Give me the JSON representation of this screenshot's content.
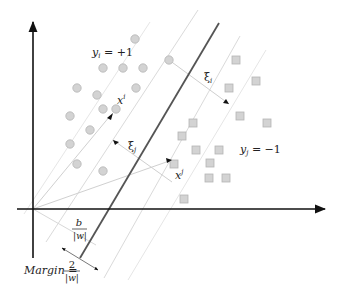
{
  "diagram": {
    "labels": {
      "class_pos": "y",
      "class_pos_sub": "i",
      "class_pos_eq": " = +1",
      "class_neg": "y",
      "class_neg_sub": "j",
      "class_neg_eq": " = −1",
      "xi_top": "ξ",
      "xi_top_sub": "i",
      "xi_mid": "ξ",
      "xi_mid_sub": "j",
      "point_i": "x",
      "point_i_sup": "i",
      "point_j": "x",
      "point_j_sup": "j",
      "bias_num": "b",
      "bias_den": "|w|",
      "margin_label": "Margin",
      "margin_eq": " = ",
      "margin_num": "2",
      "margin_den": "|w|"
    },
    "colors": {
      "axis": "#111111",
      "hyperplane": "#555555",
      "margin_line": "#d8d8d8",
      "guide_line": "#cfcfcf",
      "point_fill": "#d3d3d3",
      "point_stroke": "#b5b5b5"
    },
    "circles": [
      [
        135,
        39
      ],
      [
        103,
        68
      ],
      [
        123,
        68
      ],
      [
        143,
        68
      ],
      [
        169,
        60
      ],
      [
        77,
        88
      ],
      [
        97,
        95
      ],
      [
        136,
        88
      ],
      [
        103,
        109
      ],
      [
        116,
        109
      ],
      [
        70,
        116
      ],
      [
        90,
        130
      ],
      [
        70,
        144
      ],
      [
        77,
        164
      ],
      [
        103,
        171
      ]
    ],
    "squares": [
      [
        236,
        60
      ],
      [
        256,
        81
      ],
      [
        229,
        88
      ],
      [
        193,
        123
      ],
      [
        182,
        136
      ],
      [
        240,
        116
      ],
      [
        267,
        123
      ],
      [
        210,
        163
      ],
      [
        196,
        150
      ],
      [
        219,
        150
      ],
      [
        174,
        164
      ],
      [
        209,
        178
      ],
      [
        184,
        199
      ],
      [
        226,
        178
      ]
    ]
  }
}
